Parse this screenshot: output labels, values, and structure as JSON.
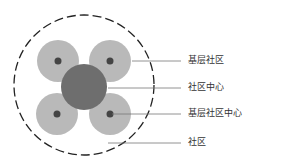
{
  "diagram": {
    "labels": [
      {
        "text": "基层社区",
        "target": "small-circle"
      },
      {
        "text": "社区中心",
        "target": "center-circle"
      },
      {
        "text": "基层社区中心",
        "target": "small-circle-center-dot"
      },
      {
        "text": "社区",
        "target": "outer-dashed-circle"
      }
    ],
    "colors": {
      "small_circle": "#b9b9b9",
      "center_circle": "#6e6e6e",
      "dot": "#444444",
      "outline": "#222222",
      "leader_line": "#777777"
    }
  }
}
